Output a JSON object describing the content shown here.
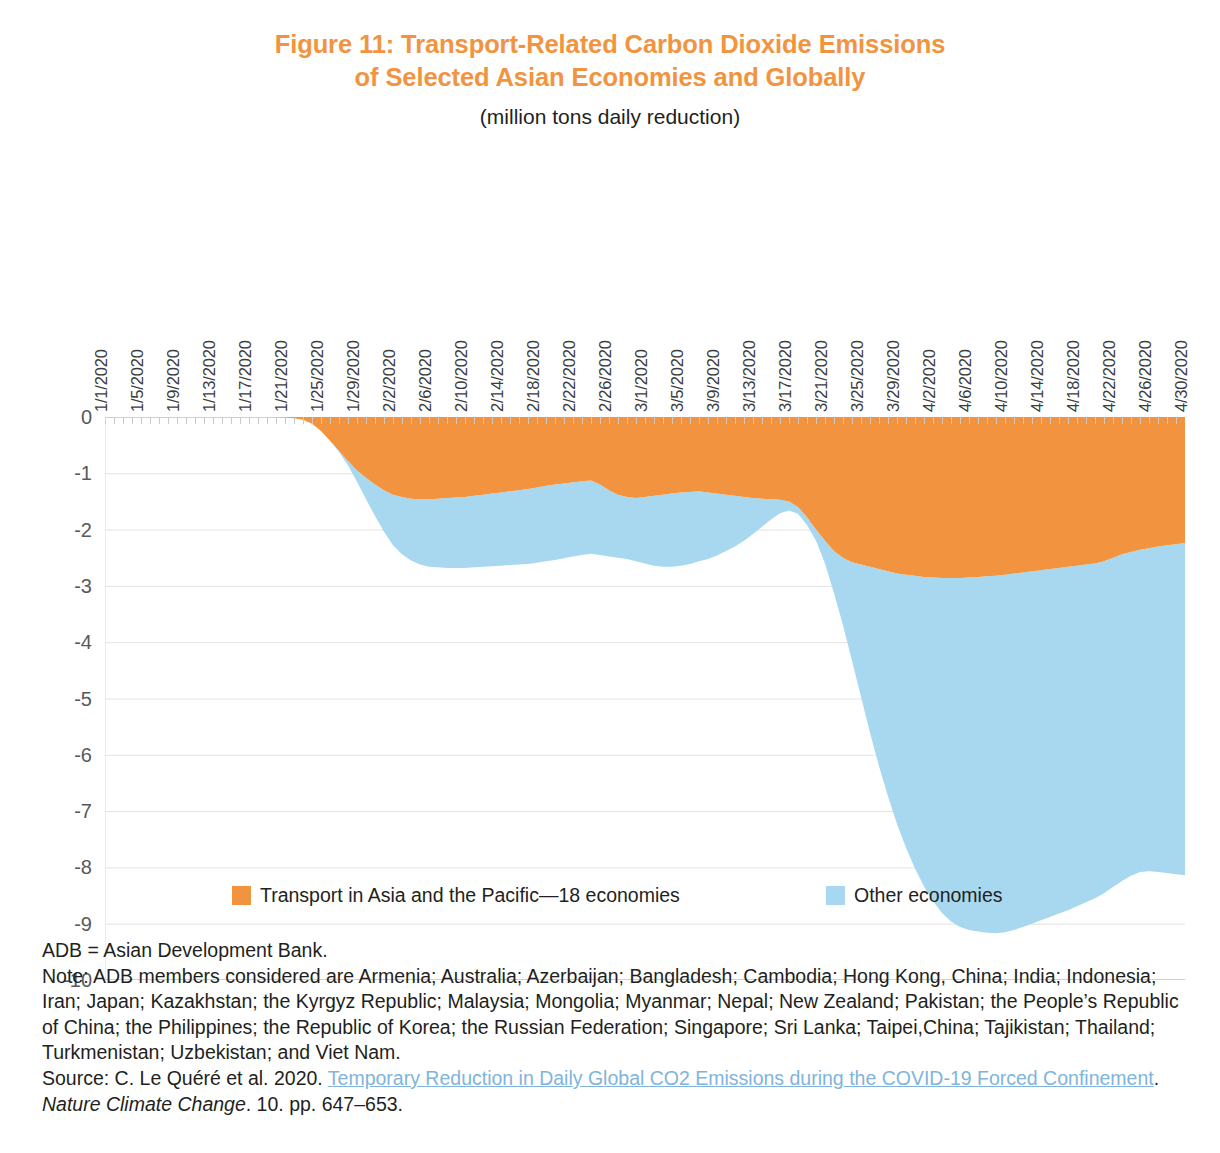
{
  "figure": {
    "title_line1": "Figure 11: Transport-Related Carbon Dioxide Emissions",
    "title_line2": "of Selected Asian Economies and Globally",
    "subtitle": "(million tons daily reduction)",
    "title_color": "#F2943F"
  },
  "legend": {
    "items": [
      {
        "label": "Transport in Asia and the Pacific—18 economies",
        "color": "#F2943F"
      },
      {
        "label": "Other economies",
        "color": "#A8D8F0"
      }
    ]
  },
  "notes": {
    "abbreviation": "ADB = Asian Development Bank.",
    "note": "Note: ADB members considered are Armenia; Australia; Azerbaijan; Bangladesh; Cambodia; Hong Kong, China; India; Indonesia; Iran; Japan; Kazakhstan; the Kyrgyz Republic; Malaysia; Mongolia; Myanmar; Nepal; New Zealand; Pakistan; the People’s Republic of China; the Philippines; the Republic of Korea; the Russian Federation; Singapore; Sri Lanka; Taipei,China; Tajikistan; Thailand; Turkmenistan; Uzbekistan; and Viet Nam.",
    "source_prefix": "Source: C. Le Quéré et al. 2020. ",
    "source_link": "Temporary Reduction in Daily Global CO2 Emissions during the COVID-19 Forced Confinement",
    "source_after_link": ". ",
    "source_journal": "Nature Climate Change",
    "source_suffix": ". 10. pp. 647–653.",
    "link_color": "#7FB4DC"
  },
  "chart_data": {
    "type": "area",
    "stacked": true,
    "title": "Figure 11: Transport-Related Carbon Dioxide Emissions of Selected Asian Economies and Globally",
    "subtitle": "(million tons daily reduction)",
    "xlabel": "",
    "ylabel": "",
    "ylim": [
      -10,
      0
    ],
    "yticks": [
      0,
      -1,
      -2,
      -3,
      -4,
      -5,
      -6,
      -7,
      -8,
      -9,
      -10
    ],
    "ytick_labels": [
      "0",
      "-1",
      "-2",
      "-3",
      "-4",
      "-5",
      "-6",
      "-7",
      "-8",
      "-9",
      "-10"
    ],
    "grid": true,
    "grid_axis": "y",
    "legend_position": "bottom",
    "xtick_labels": [
      "1/1/2020",
      "1/5/2020",
      "1/9/2020",
      "1/13/2020",
      "1/17/2020",
      "1/21/2020",
      "1/25/2020",
      "1/29/2020",
      "2/2/2020",
      "2/6/2020",
      "2/10/2020",
      "2/14/2020",
      "2/18/2020",
      "2/22/2020",
      "2/26/2020",
      "3/1/2020",
      "3/5/2020",
      "3/9/2020",
      "3/13/2020",
      "3/17/2020",
      "3/21/2020",
      "3/25/2020",
      "3/29/2020",
      "4/2/2020",
      "4/6/2020",
      "4/10/2020",
      "4/14/2020",
      "4/18/2020",
      "4/22/2020",
      "4/26/2020",
      "4/30/2020"
    ],
    "x_start": "1/1/2020",
    "x_end": "4/30/2020",
    "x_step_days": 1,
    "n_points": 121,
    "series": [
      {
        "name": "Transport in Asia and the Pacific—18 economies",
        "color": "#F2943F",
        "values": [
          0,
          0,
          0,
          0,
          0,
          0,
          0,
          0,
          0,
          0,
          0,
          0,
          0,
          0,
          0,
          0,
          0,
          0,
          0,
          0,
          -0.01,
          -0.02,
          -0.05,
          -0.12,
          -0.25,
          -0.42,
          -0.6,
          -0.78,
          -0.95,
          -1.08,
          -1.2,
          -1.3,
          -1.38,
          -1.42,
          -1.45,
          -1.46,
          -1.46,
          -1.45,
          -1.44,
          -1.43,
          -1.42,
          -1.4,
          -1.38,
          -1.36,
          -1.34,
          -1.32,
          -1.3,
          -1.28,
          -1.25,
          -1.22,
          -1.2,
          -1.18,
          -1.16,
          -1.14,
          -1.13,
          -1.2,
          -1.3,
          -1.38,
          -1.42,
          -1.44,
          -1.42,
          -1.4,
          -1.38,
          -1.36,
          -1.34,
          -1.33,
          -1.32,
          -1.34,
          -1.36,
          -1.38,
          -1.4,
          -1.42,
          -1.44,
          -1.45,
          -1.46,
          -1.47,
          -1.5,
          -1.6,
          -1.78,
          -2.0,
          -2.2,
          -2.38,
          -2.5,
          -2.58,
          -2.62,
          -2.66,
          -2.7,
          -2.74,
          -2.78,
          -2.8,
          -2.82,
          -2.84,
          -2.85,
          -2.86,
          -2.86,
          -2.86,
          -2.85,
          -2.84,
          -2.83,
          -2.82,
          -2.8,
          -2.78,
          -2.76,
          -2.74,
          -2.72,
          -2.7,
          -2.68,
          -2.66,
          -2.64,
          -2.62,
          -2.6,
          -2.56,
          -2.5,
          -2.44,
          -2.4,
          -2.36,
          -2.33,
          -2.3,
          -2.28,
          -2.26,
          -2.24
        ]
      },
      {
        "name": "Other economies",
        "color": "#A8D8F0",
        "values": [
          0,
          0,
          0,
          0,
          0,
          0,
          0,
          0,
          0,
          0,
          0,
          0,
          0,
          0,
          0,
          0,
          0,
          0,
          0,
          0,
          0,
          0,
          0,
          0,
          0,
          0,
          -0.02,
          -0.08,
          -0.2,
          -0.38,
          -0.56,
          -0.74,
          -0.9,
          -1.02,
          -1.1,
          -1.16,
          -1.2,
          -1.22,
          -1.24,
          -1.25,
          -1.26,
          -1.27,
          -1.28,
          -1.29,
          -1.3,
          -1.31,
          -1.32,
          -1.33,
          -1.34,
          -1.34,
          -1.34,
          -1.33,
          -1.32,
          -1.31,
          -1.3,
          -1.25,
          -1.18,
          -1.12,
          -1.1,
          -1.12,
          -1.18,
          -1.24,
          -1.28,
          -1.3,
          -1.3,
          -1.28,
          -1.24,
          -1.18,
          -1.1,
          -1.0,
          -0.9,
          -0.78,
          -0.64,
          -0.5,
          -0.36,
          -0.24,
          -0.16,
          -0.12,
          -0.14,
          -0.2,
          -0.4,
          -0.75,
          -1.2,
          -1.75,
          -2.35,
          -2.95,
          -3.5,
          -4.0,
          -4.45,
          -4.85,
          -5.2,
          -5.5,
          -5.75,
          -5.95,
          -6.1,
          -6.2,
          -6.26,
          -6.3,
          -6.33,
          -6.35,
          -6.35,
          -6.33,
          -6.3,
          -6.26,
          -6.22,
          -6.18,
          -6.14,
          -6.1,
          -6.05,
          -6.0,
          -5.95,
          -5.9,
          -5.85,
          -5.8,
          -5.75,
          -5.72,
          -5.74,
          -5.78,
          -5.82,
          -5.86,
          -5.9
        ]
      }
    ],
    "total_min_value": -9.2,
    "total_min_date": "4/11/2020",
    "total_end_value": -8.14,
    "annotations": []
  }
}
